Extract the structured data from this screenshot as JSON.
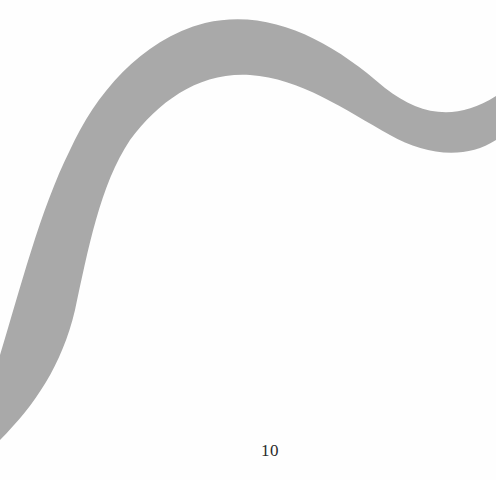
{
  "page": {
    "background_color": "#fefefe",
    "page_number": "10"
  },
  "figure": {
    "shape": "s-curve-band",
    "fill_color": "#a9a9a9"
  }
}
